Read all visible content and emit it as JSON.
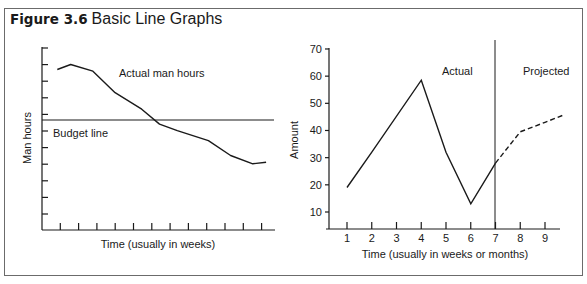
{
  "figure": {
    "label": "Figure 3.6",
    "title": "Basic Line Graphs"
  },
  "chart_data": [
    {
      "type": "line",
      "title": "",
      "xlabel": "Time (usually in weeks)",
      "ylabel": "Man hours",
      "x_ticks_count": 12,
      "y_ticks_count": 11,
      "tick_labels_shown": false,
      "grid": false,
      "series": [
        {
          "name": "Actual man hours",
          "style": "solid",
          "points_px_relative": "unlabeled axes; values normalized 0-10 on y",
          "x": [
            0.3,
            0.6,
            1.1,
            1.6,
            1.9,
            2.2,
            2.6,
            3.0,
            3.7,
            4.2,
            4.7,
            5.0
          ],
          "y": [
            9.7,
            10.0,
            9.6,
            8.3,
            7.8,
            7.3,
            6.4,
            6.0,
            5.4,
            4.5,
            4.0,
            4.1
          ]
        },
        {
          "name": "Budget line",
          "style": "solid-horizontal",
          "y": 6.5
        }
      ],
      "annotations": [
        "Actual man hours",
        "Budget line"
      ]
    },
    {
      "type": "line",
      "title": "",
      "xlabel": "Time (usually in weeks or months)",
      "ylabel": "Amount",
      "x_ticks": [
        1,
        2,
        3,
        4,
        5,
        6,
        7,
        8,
        9
      ],
      "y_ticks": [
        10,
        20,
        30,
        40,
        50,
        60,
        70
      ],
      "ylim": [
        3.5,
        70
      ],
      "grid": false,
      "divider_x": 7,
      "regions": [
        "Actual",
        "Projected"
      ],
      "series": [
        {
          "name": "Actual",
          "style": "solid",
          "x": [
            1,
            2,
            4,
            5,
            6,
            7
          ],
          "y": [
            19,
            32,
            58.5,
            32,
            13,
            28
          ]
        },
        {
          "name": "Projected",
          "style": "dashed",
          "x": [
            7,
            8,
            9,
            9.7
          ],
          "y": [
            28,
            39.5,
            43,
            45.5
          ]
        }
      ]
    }
  ],
  "left_chart": {
    "ylabel": "Man hours",
    "xlabel": "Time (usually in weeks)",
    "actual_label": "Actual man hours",
    "budget_label": "Budget line"
  },
  "right_chart": {
    "ylabel": "Amount",
    "xlabel": "Time (usually in weeks or months)",
    "actual_label": "Actual",
    "projected_label": "Projected",
    "y_ticks": [
      "10",
      "20",
      "30",
      "40",
      "50",
      "60",
      "70"
    ],
    "x_ticks": [
      "1",
      "2",
      "3",
      "4",
      "5",
      "6",
      "7",
      "8",
      "9"
    ]
  },
  "colors": {
    "line": "#1a1a1a",
    "frame": "#6b6b6b",
    "background": "#ffffff"
  }
}
